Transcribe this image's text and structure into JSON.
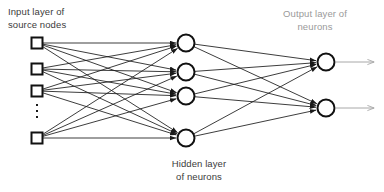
{
  "diagram": {
    "title_input": "Input layer of\nsource nodes",
    "title_output": "Output layer of\nneurons",
    "title_hidden": "Hidden layer\nof neurons",
    "colors": {
      "node_stroke": "#111111",
      "node_fill": "#ffffff",
      "edge": "#1a1a1a",
      "output_arrow": "#a8a8a8",
      "label_dark": "#3b3b3b",
      "label_gray": "#9a9a9a",
      "background": "#ffffff"
    },
    "layers": {
      "input": {
        "name": "input-layer",
        "shape": "square",
        "count": 4,
        "has_ellipsis": true,
        "ellipsis_glyph": "vertical-ellipsis",
        "nodes": [
          {
            "id": "input-node-1",
            "cx": 37,
            "cy": 43,
            "size": 11
          },
          {
            "id": "input-node-2",
            "cx": 37,
            "cy": 69,
            "size": 11
          },
          {
            "id": "input-node-3",
            "cx": 37,
            "cy": 91,
            "size": 11
          },
          {
            "id": "input-node-4",
            "cx": 37,
            "cy": 138,
            "size": 11
          }
        ]
      },
      "hidden": {
        "name": "hidden-layer",
        "shape": "circle",
        "count": 4,
        "nodes": [
          {
            "id": "hidden-node-1",
            "cx": 186,
            "cy": 43,
            "r": 8.5
          },
          {
            "id": "hidden-node-2",
            "cx": 186,
            "cy": 72,
            "r": 8.5
          },
          {
            "id": "hidden-node-3",
            "cx": 186,
            "cy": 96,
            "r": 8.5
          },
          {
            "id": "hidden-node-4",
            "cx": 186,
            "cy": 138,
            "r": 8.5
          }
        ]
      },
      "output": {
        "name": "output-layer",
        "shape": "circle",
        "count": 2,
        "nodes": [
          {
            "id": "output-node-1",
            "cx": 326,
            "cy": 62,
            "r": 8.5
          },
          {
            "id": "output-node-2",
            "cx": 326,
            "cy": 108,
            "r": 8.5
          }
        ],
        "exit_arrows": [
          {
            "id": "output-arrow-1",
            "x1": 335,
            "y1": 62,
            "x2": 374,
            "y2": 62
          },
          {
            "id": "output-arrow-2",
            "x1": 335,
            "y1": 108,
            "x2": 374,
            "y2": 108
          }
        ]
      }
    },
    "connectivity": {
      "input_to_hidden": "fully-connected",
      "hidden_to_output": "fully-connected",
      "edge_count_input_hidden": 16,
      "edge_count_hidden_output": 8,
      "direction": "left-to-right",
      "arrowheads": true
    }
  }
}
